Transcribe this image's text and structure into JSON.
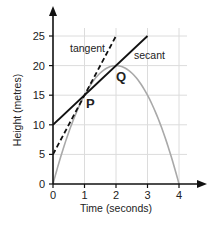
{
  "chart_data": {
    "type": "line",
    "title": "",
    "xlabel": "Time (seconds)",
    "ylabel": "Height (metres)",
    "xlim": [
      0,
      4
    ],
    "ylim": [
      0,
      25
    ],
    "x_ticks": [
      0,
      1,
      2,
      3,
      4
    ],
    "y_ticks": [
      0,
      5,
      10,
      15,
      20,
      25
    ],
    "x_tick_labels": [
      "0",
      "1",
      "2",
      "3",
      "4"
    ],
    "y_tick_labels": [
      "0",
      "5",
      "10",
      "15",
      "20",
      "25"
    ],
    "grid": true,
    "series": [
      {
        "name": "height curve",
        "equation": "h = 20t - 5t^2",
        "x": [
          0,
          0.5,
          1,
          1.5,
          2,
          2.5,
          3,
          3.5,
          4
        ],
        "y": [
          0,
          8.75,
          15,
          18.75,
          20,
          18.75,
          15,
          8.75,
          0
        ],
        "color": "#a9a9a9",
        "style": "solid"
      },
      {
        "name": "tangent",
        "label": "tangent",
        "x": [
          0,
          2
        ],
        "y": [
          5,
          25
        ],
        "color": "#111111",
        "style": "dashed"
      },
      {
        "name": "secant",
        "label": "secant",
        "x": [
          0,
          3
        ],
        "y": [
          10,
          25
        ],
        "color": "#111111",
        "style": "solid"
      }
    ],
    "annotations": [
      {
        "text": "P",
        "x": 1,
        "y": 15
      },
      {
        "text": "Q",
        "x": 2,
        "y": 20
      },
      {
        "text": "tangent",
        "x": 1.1,
        "y": 23.5
      },
      {
        "text": "secant",
        "x": 2.6,
        "y": 22
      }
    ]
  }
}
